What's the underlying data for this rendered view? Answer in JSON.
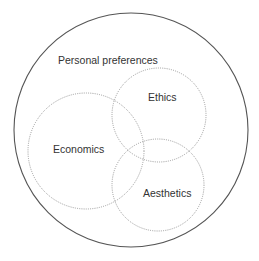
{
  "diagram": {
    "type": "venn",
    "outer": {
      "label": "Personal preferences",
      "cx": 131,
      "cy": 130,
      "r": 117,
      "stroke": "#555555",
      "style": "solid",
      "label_x": 58,
      "label_y": 64
    },
    "sets": [
      {
        "label": "Ethics",
        "cx": 159,
        "cy": 115,
        "r": 47,
        "stroke": "#9a9a9a",
        "style": "dotted",
        "label_x": 148,
        "label_y": 101
      },
      {
        "label": "Economics",
        "cx": 86,
        "cy": 151,
        "r": 58,
        "stroke": "#9a9a9a",
        "style": "dotted",
        "label_x": 53,
        "label_y": 153
      },
      {
        "label": "Aesthetics",
        "cx": 158,
        "cy": 185,
        "r": 46,
        "stroke": "#9a9a9a",
        "style": "dotted",
        "label_x": 143,
        "label_y": 197
      }
    ],
    "text_color": "#333333"
  }
}
